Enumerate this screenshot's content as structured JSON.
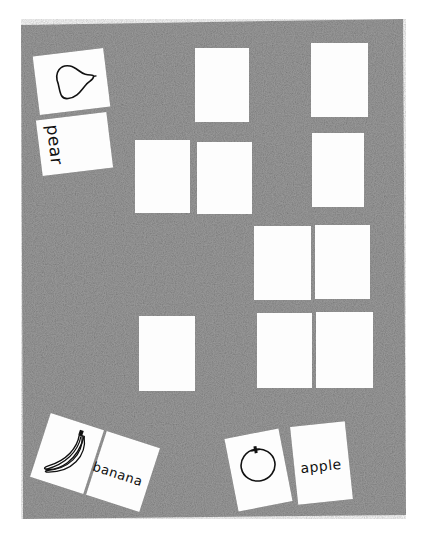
{
  "scene": {
    "description": "Matching game board with face-down cards and matched picture/word pairs",
    "board_color": "#8a8a8a",
    "card_color": "#fdfdfd"
  },
  "matched_pairs": [
    {
      "fruit": "pear",
      "word": "pear"
    },
    {
      "fruit": "banana",
      "word": "banana"
    },
    {
      "fruit": "apple",
      "word": "apple"
    }
  ],
  "face_down_cards": [
    {
      "id": 1
    },
    {
      "id": 2
    },
    {
      "id": 3
    },
    {
      "id": 4
    },
    {
      "id": 5
    },
    {
      "id": 6
    },
    {
      "id": 7
    },
    {
      "id": 8
    },
    {
      "id": 9
    },
    {
      "id": 10
    }
  ]
}
